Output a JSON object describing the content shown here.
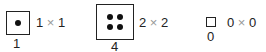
{
  "items": [
    {
      "rows": "1",
      "cols": "1",
      "times": "×",
      "count": "1",
      "dots": 1
    },
    {
      "rows": "2",
      "cols": "2",
      "times": "×",
      "count": "4",
      "dots": 4
    },
    {
      "rows": "0",
      "cols": "0",
      "times": "×",
      "count": "0",
      "dots": 0
    }
  ]
}
